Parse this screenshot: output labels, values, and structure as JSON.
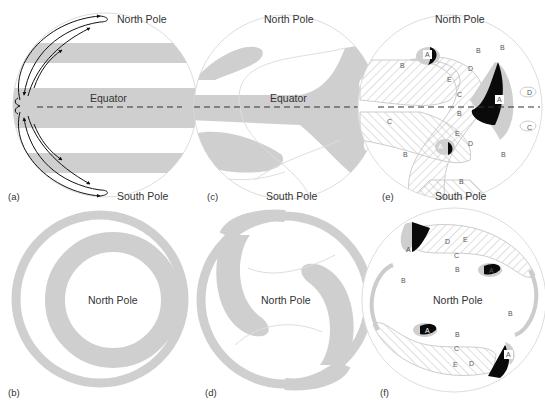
{
  "colors": {
    "shade": "#cfcfcf",
    "outline": "#d8d8d8",
    "dark": "#0a0a0a",
    "text": "#333333",
    "hatch": "#c8c8c8"
  },
  "panels": {
    "a": {
      "tag": "(a)",
      "top_label": "North Pole",
      "equator_label": "Equator",
      "bottom_label": "South Pole"
    },
    "b": {
      "tag": "(b)",
      "center_label": "North Pole"
    },
    "c": {
      "tag": "(c)",
      "top_label": "North Pole",
      "equator_label": "Equator",
      "bottom_label": "South Pole"
    },
    "d": {
      "tag": "(d)",
      "center_label": "North Pole"
    },
    "e": {
      "tag": "(e)",
      "top_label": "North Pole",
      "bottom_label": "South Pole",
      "region_letters": [
        "A",
        "B",
        "C",
        "D",
        "E"
      ]
    },
    "f": {
      "tag": "(f)",
      "center_label": "North Pole",
      "region_letters": [
        "A",
        "B",
        "C",
        "D",
        "E"
      ]
    }
  },
  "letters": {
    "A": "A",
    "B": "B",
    "C": "C",
    "D": "D",
    "E": "E"
  }
}
